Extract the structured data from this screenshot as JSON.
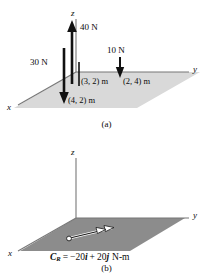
{
  "figure": {
    "title_implicit": "Resultant couple moment of a force system",
    "colors": {
      "plane_top_fill": "#d9d9d9",
      "plane_bottom_fill": "#8c8c8c",
      "axis_line": "#6e6e6e",
      "arrow_black": "#111111",
      "text": "#0b0b0b",
      "background": "#ffffff"
    },
    "panels": [
      {
        "id": "a",
        "caption": "(a)",
        "axes": [
          {
            "name": "z-axis",
            "label": "z"
          },
          {
            "name": "y-axis",
            "label": "y"
          },
          {
            "name": "x-axis",
            "label": "x"
          }
        ],
        "forces": [
          {
            "name": "force-40N",
            "label": "40 N",
            "direction": "up",
            "magnitude": 40,
            "unit": "N"
          },
          {
            "name": "force-30N",
            "label": "30 N",
            "direction": "down",
            "magnitude": 30,
            "unit": "N"
          },
          {
            "name": "force-10N",
            "label": "10 N",
            "direction": "down",
            "magnitude": 10,
            "unit": "N"
          }
        ],
        "coordinates": [
          {
            "name": "point-3-2",
            "label": "(3, 2) m",
            "x": 3,
            "y": 2,
            "unit": "m"
          },
          {
            "name": "point-4-2",
            "label": "(4, 2) m",
            "x": 4,
            "y": 2,
            "unit": "m"
          },
          {
            "name": "point-2-4",
            "label": "(2, 4) m",
            "x": 2,
            "y": 4,
            "unit": "m"
          }
        ]
      },
      {
        "id": "b",
        "caption": "(b)",
        "axes": [
          {
            "name": "z-axis",
            "label": "z"
          },
          {
            "name": "y-axis",
            "label": "y"
          },
          {
            "name": "x-axis",
            "label": "x"
          }
        ],
        "couple": {
          "name": "resultant-couple-moment",
          "symbol": "C",
          "subscript": "R",
          "equals": "=",
          "term_i": "−20",
          "unit_i": "i",
          "plus": "+",
          "term_j": "20",
          "unit_j": "j",
          "units": "N-m",
          "full_label": "C_R = −20i + 20j N-m"
        }
      }
    ]
  }
}
